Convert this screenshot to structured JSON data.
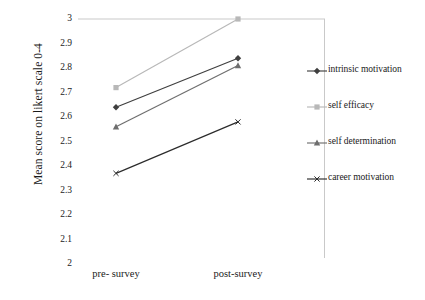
{
  "chart_data": {
    "type": "line",
    "title": "",
    "xlabel": "",
    "ylabel": "Mean score on likert scale 0-4",
    "categories": [
      "pre- survey",
      "post-survey"
    ],
    "ylim": [
      2,
      3
    ],
    "yticks": [
      "3",
      "2.9",
      "2.8",
      "2.7",
      "2.6",
      "2.5",
      "2.4",
      "2.3",
      "2.2",
      "2.1",
      "2"
    ],
    "ytick_values": [
      3,
      2.9,
      2.8,
      2.7,
      2.6,
      2.5,
      2.4,
      2.3,
      2.2,
      2.1,
      2
    ],
    "grid": false,
    "gridlines_y": [
      3
    ],
    "legend_position": "right",
    "series": [
      {
        "name": "intrinsic motivation",
        "values": [
          2.64,
          2.84
        ],
        "marker": "diamond",
        "color": "#3f3f3f"
      },
      {
        "name": "self efficacy",
        "values": [
          2.72,
          3.0
        ],
        "marker": "square",
        "color": "#b8b8b8"
      },
      {
        "name": "self determination",
        "values": [
          2.56,
          2.81
        ],
        "marker": "triangle",
        "color": "#6e6e6e"
      },
      {
        "name": "career motivation",
        "values": [
          2.37,
          2.58
        ],
        "marker": "x",
        "color": "#2b2b2b"
      }
    ]
  },
  "axis": {
    "y_title": "Mean score on likert scale 0-4"
  },
  "colors": {
    "axis_line": "#c9c9c9",
    "text": "#1a1a1a",
    "background": "#ffffff"
  }
}
